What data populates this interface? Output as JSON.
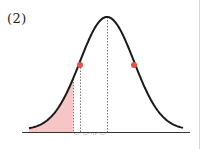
{
  "figure": {
    "label": "(2)"
  },
  "colors": {
    "curve": "#1a1a1a",
    "shade": "#f6c6c6",
    "points": "#e8504a",
    "dotted": "#555555",
    "axis": "#333333",
    "border": "#d8d8d8"
  },
  "curve": {
    "type": "normal",
    "mean_x": 107,
    "peak_y": 21,
    "baseline_y": 132,
    "sigma_px": 27,
    "x_start": 29,
    "x_end": 183
  },
  "points": [
    {
      "name": "left-inflection",
      "x": 80,
      "y": 65
    },
    {
      "name": "right-inflection",
      "x": 134,
      "y": 65
    }
  ],
  "dotted_lines": [
    {
      "name": "shade-boundary",
      "x": 73
    },
    {
      "name": "inflection-left",
      "x": 80
    },
    {
      "name": "mean",
      "x": 107
    }
  ],
  "shaded_region": {
    "from_x": 29,
    "to_x": 73
  }
}
